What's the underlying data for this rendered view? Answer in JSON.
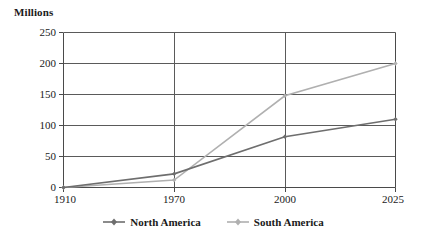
{
  "chart_data": {
    "type": "line",
    "title": "",
    "ylabel": "Millions",
    "xlabel": "",
    "categories": [
      "1910",
      "1970",
      "2000",
      "2025"
    ],
    "ylim": [
      0,
      250
    ],
    "yticks": [
      "0",
      "50",
      "100",
      "150",
      "200",
      "250"
    ],
    "grid": "horizontal-and-category-verticals",
    "legend_position": "bottom-center",
    "series": [
      {
        "name": "North America",
        "color": "#6e6e6e",
        "marker": "diamond",
        "values": [
          0,
          22,
          82,
          110
        ]
      },
      {
        "name": "South America",
        "color": "#b0b0b0",
        "marker": "diamond",
        "values": [
          0,
          12,
          148,
          200
        ]
      }
    ]
  },
  "axes": {
    "unit_title": "Millions",
    "y_tick_labels": [
      "250",
      "200",
      "150",
      "100",
      "50",
      "0"
    ],
    "x_tick_labels": [
      "1910",
      "1970",
      "2000",
      "2025"
    ]
  },
  "legend": {
    "items": [
      {
        "label": "North America",
        "color": "#6e6e6e"
      },
      {
        "label": "South America",
        "color": "#b0b0b0"
      }
    ]
  },
  "style": {
    "axis_color": "#4a4a4a",
    "grid_color": "#5a5a5a",
    "text_color": "#1a1a1a",
    "background": "#ffffff"
  }
}
